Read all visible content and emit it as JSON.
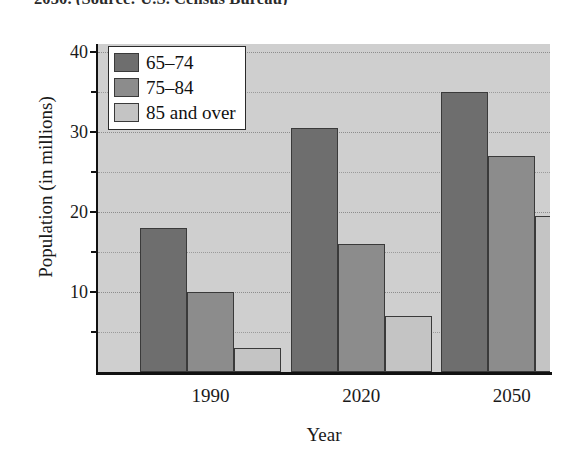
{
  "caption": "2050. (Source: U.S. Census Bureau)",
  "chart_data": {
    "type": "bar",
    "title": "",
    "xlabel": "Year",
    "ylabel": "Population (in millions)",
    "categories": [
      "1990",
      "2020",
      "2050"
    ],
    "series": [
      {
        "name": "65–74",
        "color": "#6e6e6e",
        "values": [
          18.0,
          30.5,
          35.0
        ]
      },
      {
        "name": "75–84",
        "color": "#8c8c8c",
        "values": [
          10.0,
          16.0,
          27.0
        ]
      },
      {
        "name": "85 and over",
        "color": "#c4c4c4",
        "values": [
          3.0,
          7.0,
          19.5
        ]
      }
    ],
    "ylim": [
      0,
      41
    ],
    "yticks": [
      10,
      20,
      30,
      40
    ],
    "ytick_labels": [
      "10",
      "20",
      "30",
      "40"
    ],
    "yticks_minor": [
      5,
      15,
      25,
      35
    ],
    "grid": true,
    "gridlines": [
      5,
      10,
      15,
      20,
      25,
      30,
      35,
      40
    ],
    "legend_position": "upper left",
    "plot_background": "#cfcfcf"
  }
}
